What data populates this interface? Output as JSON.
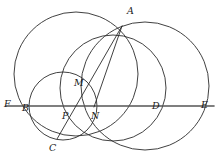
{
  "figure": {
    "background_color": "#ffffff",
    "stroke_color": "#2b2b2b",
    "line_color": "#555555",
    "width": 221,
    "height": 161
  },
  "labels": [
    {
      "id": "A",
      "text": "A",
      "x": 127,
      "y": 6
    },
    {
      "id": "M",
      "text": "M",
      "x": 74,
      "y": 78
    },
    {
      "id": "F",
      "text": "F",
      "x": 4,
      "y": 99
    },
    {
      "id": "B",
      "text": "B",
      "x": 22,
      "y": 103
    },
    {
      "id": "P",
      "text": "P",
      "x": 62,
      "y": 111
    },
    {
      "id": "N",
      "text": "N",
      "x": 91,
      "y": 111
    },
    {
      "id": "D",
      "text": "D",
      "x": 152,
      "y": 101
    },
    {
      "id": "E",
      "text": "E",
      "x": 201,
      "y": 100
    },
    {
      "id": "C",
      "text": "C",
      "x": 49,
      "y": 143
    }
  ],
  "points": [
    {
      "id": "A",
      "x": 122,
      "y": 26
    },
    {
      "id": "M",
      "x": 84,
      "y": 84
    },
    {
      "id": "F",
      "x": 14,
      "y": 106
    },
    {
      "id": "B",
      "x": 29,
      "y": 106
    },
    {
      "id": "P",
      "x": 71,
      "y": 106
    },
    {
      "id": "N",
      "x": 95,
      "y": 106
    },
    {
      "id": "D",
      "x": 149,
      "y": 106
    },
    {
      "id": "E",
      "x": 208,
      "y": 106
    },
    {
      "id": "C",
      "x": 59,
      "y": 138
    }
  ],
  "circles": [
    {
      "id": "large-left-circle",
      "cx": 76,
      "cy": 74,
      "r": 62
    },
    {
      "id": "small-circle",
      "cx": 63,
      "cy": 106,
      "r": 34
    },
    {
      "id": "middle-circle",
      "cx": 113,
      "cy": 88,
      "r": 53
    },
    {
      "id": "large-right-circle",
      "cx": 145,
      "cy": 86,
      "r": 64
    }
  ],
  "segments": [
    {
      "id": "line-FE",
      "x1": 6,
      "y1": 106,
      "x2": 214,
      "y2": 106
    },
    {
      "id": "chord-A-C",
      "x1": 122,
      "y1": 26,
      "x2": 57,
      "y2": 139
    },
    {
      "id": "chord-A-N",
      "x1": 122,
      "y1": 26,
      "x2": 94,
      "y2": 107
    }
  ]
}
